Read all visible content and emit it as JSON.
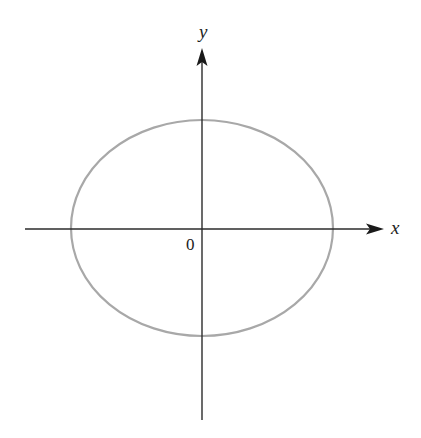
{
  "diagram": {
    "type": "ellipse-on-axes",
    "colors": {
      "axis": "#2b2b2b",
      "ellipse": "#a8a8a8",
      "background": "#ffffff",
      "text": "#222222"
    },
    "labels": {
      "x_axis": "x",
      "y_axis": "y",
      "origin": "0"
    },
    "ellipse": {
      "center": [
        202,
        228
      ],
      "rx": 131,
      "ry": 108
    },
    "axes": {
      "x_axis": {
        "from": [
          25,
          229
        ],
        "to": [
          384,
          229
        ]
      },
      "y_axis": {
        "from": [
          202,
          420
        ],
        "to": [
          202,
          48
        ]
      }
    }
  }
}
